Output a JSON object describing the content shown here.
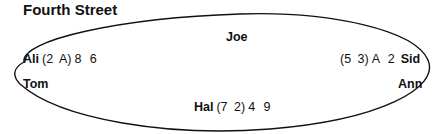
{
  "title": "Fourth Street",
  "table": {
    "shape": "ellipse",
    "stroke_color": "#111111"
  },
  "seats": [
    {
      "position": "top-center",
      "name": "Joe",
      "hole_cards": "",
      "up_cards": ""
    },
    {
      "position": "left-upper",
      "name": "Ali",
      "hole_cards": "(2  A)",
      "up_cards": "8  6"
    },
    {
      "position": "right-upper",
      "name": "Sid",
      "hole_cards": "(5  3)",
      "up_cards": "A  2"
    },
    {
      "position": "left-lower",
      "name": "Tom",
      "hole_cards": "",
      "up_cards": ""
    },
    {
      "position": "right-lower",
      "name": "Ann",
      "hole_cards": "",
      "up_cards": ""
    },
    {
      "position": "bottom-center",
      "name": "Hal",
      "hole_cards": "(7  2)",
      "up_cards": "4  9"
    }
  ]
}
